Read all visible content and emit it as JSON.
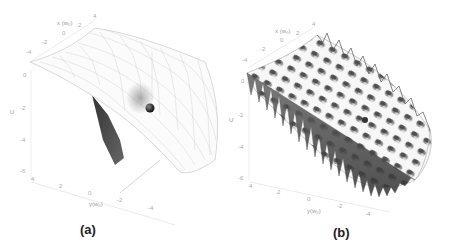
{
  "figure": {
    "panels": [
      {
        "id": "a",
        "caption": "(a)",
        "surface": "smooth-saddle-wireframe",
        "x_axis": {
          "label": "x (w₀)",
          "ticks": [
            "-4",
            "-2",
            "0",
            "2",
            "4"
          ]
        },
        "y_axis": {
          "label": "y(w₀)",
          "ticks": [
            "4",
            "2",
            "0",
            "-2",
            "-4"
          ]
        },
        "u_axis": {
          "label": "U",
          "ticks": [
            "0",
            "-2",
            "-4",
            "-6"
          ]
        }
      },
      {
        "id": "b",
        "caption": "(b)",
        "surface": "corrugated-saddle-shaded",
        "x_axis": {
          "label": "x (w₀)",
          "ticks": [
            "-4",
            "-2",
            "0",
            "2",
            "4"
          ]
        },
        "y_axis": {
          "label": "y(w₀)",
          "ticks": [
            "4",
            "2",
            "0",
            "-2",
            "-4"
          ]
        },
        "u_axis": {
          "label": "U",
          "ticks": [
            "0",
            "-2",
            "-4",
            "-6"
          ]
        }
      }
    ],
    "colors": {
      "wire": "#c8c8c8",
      "shade_dark": "#4a4a4a",
      "ball": "#222222",
      "axis": "#d6d6d6",
      "tick_text": "#aaaaaa"
    }
  }
}
